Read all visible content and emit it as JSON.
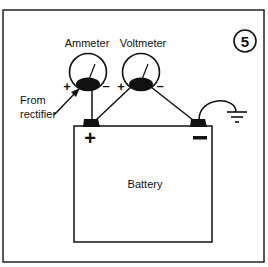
{
  "figure": {
    "number": "5",
    "labels": {
      "ammeter": "Ammeter",
      "voltmeter": "Voltmeter",
      "from_rectifier_line1": "From",
      "from_rectifier_line2": "rectifier",
      "battery": "Battery",
      "plus": "+",
      "minus": "–",
      "battery_plus": "+",
      "battery_minus": "—"
    },
    "colors": {
      "ink": "#111111",
      "background": "#ffffff"
    }
  }
}
